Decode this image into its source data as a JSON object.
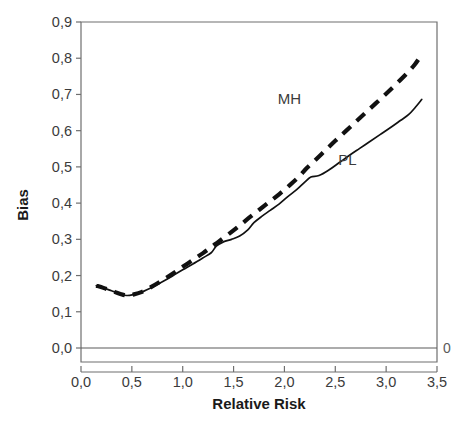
{
  "chart_data": {
    "type": "line",
    "title": "",
    "xlabel": "Relative Risk",
    "ylabel": "Bias",
    "xlim": [
      0.0,
      3.5
    ],
    "ylim": [
      0.0,
      0.9
    ],
    "grid": false,
    "legend_position": "inline-annotations",
    "xticks": [
      "0,0",
      "0,5",
      "1,0",
      "1,5",
      "2,0",
      "2,5",
      "3,0",
      "3,5"
    ],
    "xtick_values": [
      0.0,
      0.5,
      1.0,
      1.5,
      2.0,
      2.5,
      3.0,
      3.5
    ],
    "yticks": [
      "0,0",
      "0,1",
      "0,2",
      "0,3",
      "0,4",
      "0,5",
      "0,6",
      "0,7",
      "0,8",
      "0,9"
    ],
    "ytick_values": [
      0.0,
      0.1,
      0.2,
      0.3,
      0.4,
      0.5,
      0.6,
      0.7,
      0.8,
      0.9
    ],
    "right_edge_label": "0",
    "annotations": [
      {
        "text": "MH",
        "x": 2.05,
        "y": 0.675
      },
      {
        "text": "PL",
        "x": 2.62,
        "y": 0.505
      }
    ],
    "series": [
      {
        "name": "MH",
        "style": "dashed",
        "color": "#111111",
        "x": [
          0.15,
          0.22,
          0.3,
          0.38,
          0.45,
          0.52,
          0.6,
          0.7,
          0.8,
          0.9,
          1.0,
          1.1,
          1.2,
          1.3,
          1.35,
          1.45,
          1.55,
          1.65,
          1.75,
          1.85,
          1.95,
          2.05,
          2.15,
          2.22,
          2.3,
          2.4,
          2.5,
          2.6,
          2.7,
          2.8,
          2.9,
          3.0,
          3.1,
          3.2,
          3.28,
          3.35
        ],
        "values": [
          0.172,
          0.166,
          0.158,
          0.15,
          0.145,
          0.148,
          0.155,
          0.17,
          0.187,
          0.205,
          0.224,
          0.243,
          0.262,
          0.283,
          0.293,
          0.314,
          0.336,
          0.359,
          0.381,
          0.403,
          0.425,
          0.449,
          0.475,
          0.497,
          0.518,
          0.545,
          0.572,
          0.598,
          0.624,
          0.65,
          0.676,
          0.702,
          0.729,
          0.757,
          0.782,
          0.81
        ]
      },
      {
        "name": "PL",
        "style": "solid",
        "color": "#111111",
        "x": [
          0.15,
          0.22,
          0.3,
          0.38,
          0.45,
          0.52,
          0.6,
          0.7,
          0.8,
          0.9,
          1.0,
          1.1,
          1.2,
          1.28,
          1.33,
          1.4,
          1.48,
          1.56,
          1.64,
          1.7,
          1.78,
          1.86,
          1.95,
          2.03,
          2.12,
          2.2,
          2.26,
          2.34,
          2.44,
          2.54,
          2.64,
          2.74,
          2.84,
          2.94,
          3.04,
          3.14,
          3.22,
          3.28,
          3.35
        ],
        "values": [
          0.172,
          0.166,
          0.158,
          0.15,
          0.145,
          0.148,
          0.155,
          0.168,
          0.183,
          0.199,
          0.216,
          0.232,
          0.249,
          0.263,
          0.281,
          0.293,
          0.3,
          0.309,
          0.326,
          0.346,
          0.364,
          0.38,
          0.398,
          0.417,
          0.437,
          0.458,
          0.472,
          0.476,
          0.492,
          0.512,
          0.532,
          0.551,
          0.57,
          0.589,
          0.608,
          0.628,
          0.644,
          0.662,
          0.686
        ]
      }
    ]
  },
  "axes": {
    "y_title": "Bias",
    "x_title": "Relative Risk"
  }
}
